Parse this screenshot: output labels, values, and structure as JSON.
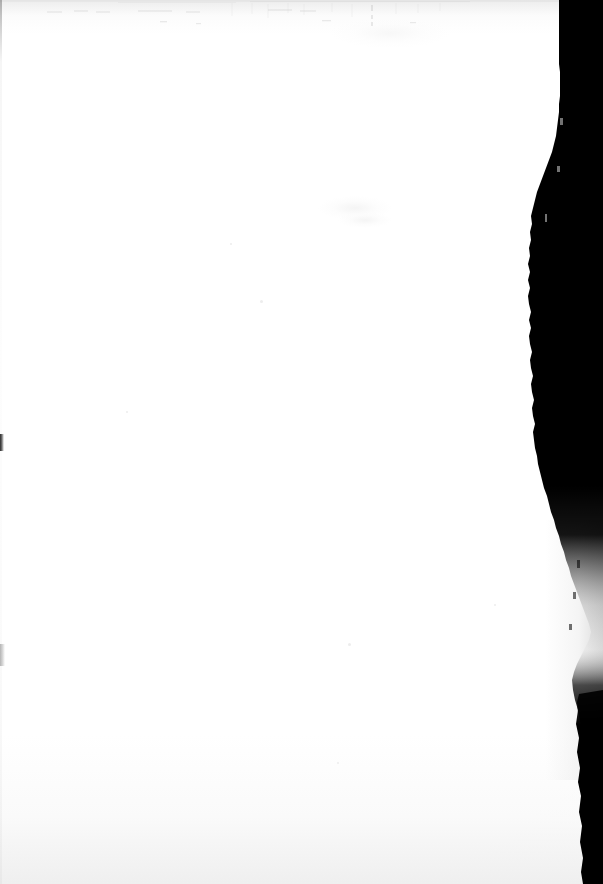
{
  "document": {
    "kind": "scanned-page",
    "page_state": "blank",
    "visible_text": "",
    "page_width_px": 603,
    "page_height_px": 884
  },
  "colors": {
    "paper_white": "#ffffff",
    "paper_offwhite": "#fbfbfb",
    "scan_shadow_black": "#000000",
    "scan_shadow_grey": "#cdcdcd",
    "edge_mark_dark": "#2a2a2a",
    "edge_mark_light": "#b4b4b4",
    "speck_grey": "#ededed"
  },
  "artifacts": {
    "gutter_shadow": {
      "name": "right-edge-scanner-shadow",
      "side": "right",
      "max_width_px": 62
    },
    "top_scanlines": {
      "name": "top-edge-scan-noise",
      "height_px": 30
    },
    "left_edge_marks": [
      {
        "name": "left-edge-dark-notch",
        "y_px": 434,
        "height_px": 17
      },
      {
        "name": "left-edge-light-notch",
        "y_px": 644,
        "height_px": 22
      }
    ],
    "specks": [
      {
        "x_px": 260,
        "y_px": 300,
        "size_px": 3
      },
      {
        "x_px": 348,
        "y_px": 643,
        "size_px": 3
      },
      {
        "x_px": 126,
        "y_px": 411,
        "size_px": 2
      },
      {
        "x_px": 494,
        "y_px": 604,
        "size_px": 2
      },
      {
        "x_px": 337,
        "y_px": 762,
        "size_px": 2
      },
      {
        "x_px": 230,
        "y_px": 243,
        "size_px": 2
      }
    ],
    "bleed_smudges": [
      {
        "x_px": 318,
        "y_px": 196,
        "w_px": 74,
        "h_px": 24
      },
      {
        "x_px": 338,
        "y_px": 212,
        "w_px": 54,
        "h_px": 16
      }
    ]
  }
}
